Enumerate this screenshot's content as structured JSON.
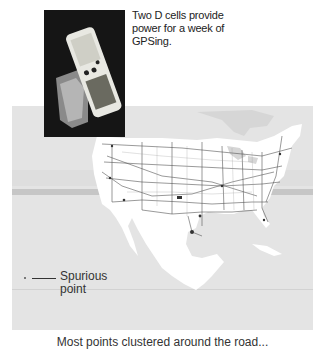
{
  "photo": {
    "subject": "handheld GPS receiver with D-cell battery pack",
    "caption": "Two D cells provide power for a week of GPSing."
  },
  "map": {
    "region": "Contiguous United States with highway network",
    "colors": {
      "ocean": "#e4e4e4",
      "land": "#ffffff",
      "roads": "#555555",
      "band_dark": "#c6c6c6"
    },
    "annotation": {
      "label_line1": "Spurious",
      "label_line2": "point"
    }
  },
  "figure": {
    "caption": "Most points clustered around the road..."
  }
}
